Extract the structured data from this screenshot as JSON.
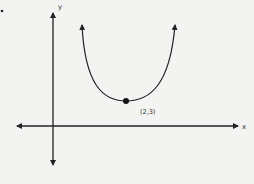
{
  "diagram": {
    "type": "parabola-graph",
    "axis_labels": {
      "x": "x",
      "y": "y"
    },
    "vertex": {
      "label": "(2,3)",
      "x": 2,
      "y": 3
    },
    "curve": "upward-opening parabola with arrows on both branches",
    "colors": {
      "line": "#222222",
      "background": "#f3f3f1"
    }
  }
}
